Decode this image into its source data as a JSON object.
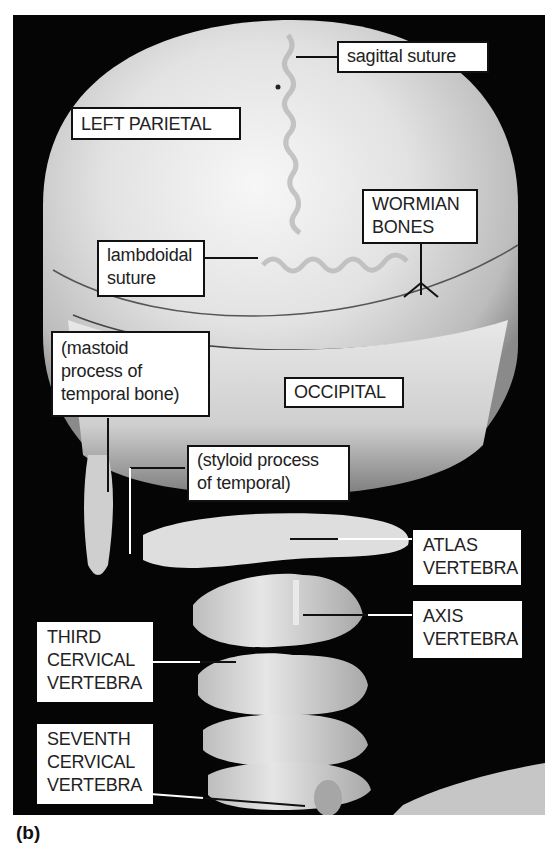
{
  "figure": {
    "caption": "(b)"
  },
  "labels": {
    "sagittal_suture": "sagittal suture",
    "left_parietal": "LEFT PARIETAL",
    "wormian_bones_1": "WORMIAN",
    "wormian_bones_2": "BONES",
    "lambdoidal_1": "lambdoidal",
    "lambdoidal_2": "suture",
    "mastoid_1": "(mastoid",
    "mastoid_2": "process of",
    "mastoid_3": "temporal bone)",
    "occipital": "OCCIPITAL",
    "styloid_1": "(styloid process",
    "styloid_2": "of temporal)",
    "atlas_1": "ATLAS",
    "atlas_2": "VERTEBRA",
    "axis_1": "AXIS",
    "axis_2": "VERTEBRA",
    "third_1": "THIRD",
    "third_2": "CERVICAL",
    "third_3": "VERTEBRA",
    "seventh_1": "SEVENTH",
    "seventh_2": "CERVICAL",
    "seventh_3": "VERTEBRA"
  },
  "colors": {
    "background": "#050505",
    "bone_light": "#e6e6e6",
    "bone_mid": "#bdbdbd",
    "bone_dark": "#7a7a7a",
    "label_bg": "#ffffff",
    "label_border": "#111111"
  }
}
